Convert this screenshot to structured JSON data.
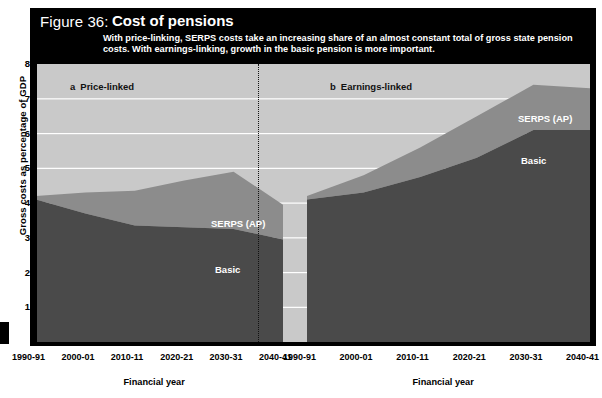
{
  "figure": {
    "number": "Figure 36:",
    "title": "Cost of pensions",
    "subtitle": "With price-linking, SERPS costs take an increasing share of an almost constant total of gross state pension costs. With earnings-linking, growth in the basic pension is more important."
  },
  "axes": {
    "ylabel": "Gross costs as percentage of GDP",
    "xlabel_left": "Financial year",
    "xlabel_right": "Financial year",
    "yticks": [
      "8",
      "7",
      "6",
      "5",
      "4",
      "3",
      "2",
      "1"
    ],
    "xticks": [
      "1990-91",
      "2000-01",
      "2010-11",
      "2020-21",
      "2030-31",
      "2040-41"
    ]
  },
  "panels": {
    "left": {
      "index": "a",
      "label": "Price-linked",
      "series_basic": "Basic",
      "series_serps": "SERPS (AP)"
    },
    "right": {
      "index": "b",
      "label": "Earnings-linked",
      "series_basic": "Basic",
      "series_serps": "SERPS (AP)"
    }
  },
  "colors": {
    "background": "#c9c9c9",
    "basic": "#4a4a4a",
    "serps": "#8c8c8c",
    "gridline": "#ffffff",
    "frame": "#000000",
    "title_text": "#ffffff"
  },
  "chart_data": {
    "type": "area",
    "title": "Cost of pensions",
    "subtitle": "With price-linking, SERPS costs take an increasing share of an almost constant total of gross state pension costs. With earnings-linking, growth in the basic pension is more important.",
    "xlabel": "Financial year",
    "ylabel": "Gross costs as percentage of GDP",
    "ylim": [
      0,
      8
    ],
    "grid": true,
    "stacked": true,
    "legend": "in-plot labels",
    "panels": [
      {
        "id": "a",
        "name": "Price-linked",
        "x": [
          "1990-91",
          "2000-01",
          "2010-11",
          "2020-21",
          "2030-31",
          "2040-41"
        ],
        "series": [
          {
            "name": "Basic",
            "values": [
              4.1,
              3.7,
              3.35,
              3.3,
              3.25,
              2.95
            ]
          },
          {
            "name": "SERPS (AP)",
            "values": [
              0.1,
              0.6,
              1.0,
              1.35,
              1.65,
              1.0
            ]
          }
        ],
        "totals": [
          4.2,
          4.3,
          4.35,
          4.65,
          4.9,
          3.95
        ]
      },
      {
        "id": "b",
        "name": "Earnings-linked",
        "x": [
          "1990-91",
          "2000-01",
          "2010-11",
          "2020-21",
          "2030-31",
          "2040-41"
        ],
        "series": [
          {
            "name": "Basic",
            "values": [
              4.1,
              4.3,
              4.75,
              5.3,
              6.1,
              6.1
            ]
          },
          {
            "name": "SERPS (AP)",
            "values": [
              0.1,
              0.5,
              0.85,
              1.2,
              1.3,
              1.2
            ]
          }
        ],
        "totals": [
          4.2,
          4.8,
          5.6,
          6.5,
          7.4,
          7.3
        ]
      }
    ]
  }
}
